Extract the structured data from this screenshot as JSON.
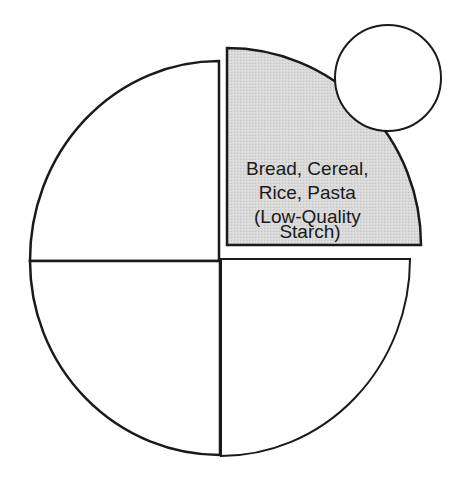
{
  "diagram": {
    "title": "",
    "quadrants": [
      {
        "id": "top-right",
        "label_lines": [
          "Bread, Cereal,",
          "Rice, Pasta",
          "(Low-Quality",
          "Starch)"
        ],
        "fill": "#d6d6d6",
        "highlighted": true
      },
      {
        "id": "top-left",
        "label_lines": [],
        "fill": "#ffffff",
        "highlighted": false
      },
      {
        "id": "bottom-left",
        "label_lines": [],
        "fill": "#ffffff",
        "highlighted": false
      },
      {
        "id": "bottom-right",
        "label_lines": [],
        "fill": "#ffffff",
        "highlighted": false
      }
    ],
    "side_circle": {
      "label": "",
      "fill": "#ffffff"
    },
    "stroke_color": "#1a1a1a"
  }
}
